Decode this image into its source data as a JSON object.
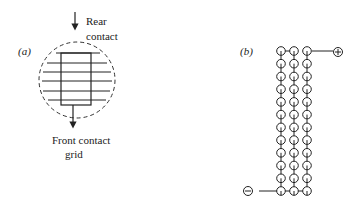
{
  "panel_a": {
    "label": "(a)",
    "rear_label_line1": "Rear",
    "rear_label_line2": "contact",
    "front_label_line1": "Front contact",
    "front_label_line2": "grid",
    "grid_lines": 6
  },
  "panel_b": {
    "label": "(b)",
    "columns": 3,
    "rows": 12,
    "positive_terminal": "+",
    "negative_terminal": "−"
  },
  "colors": {
    "stroke": "#222222",
    "background": "#ffffff"
  }
}
